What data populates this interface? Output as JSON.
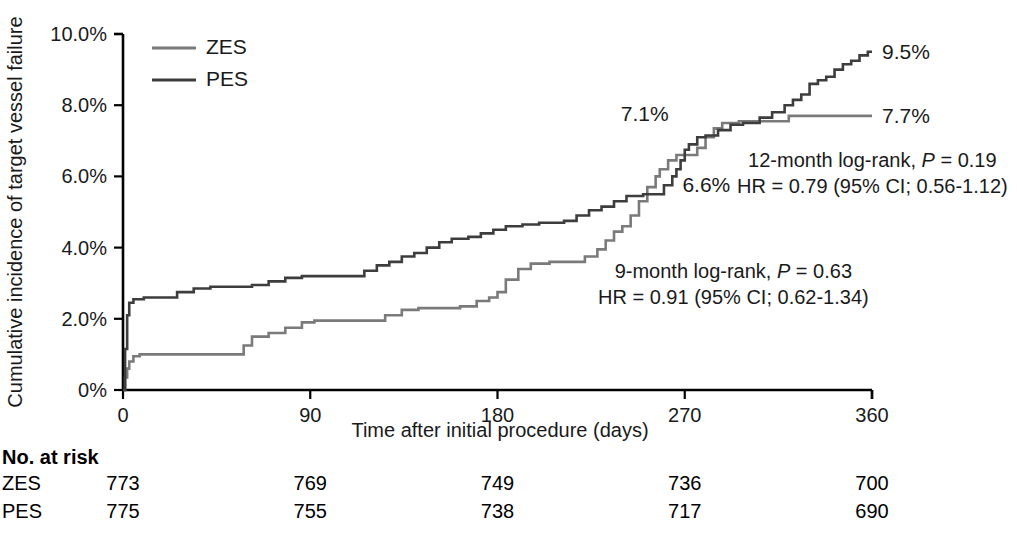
{
  "chart_data": {
    "type": "line",
    "subtype": "kaplan-meier-cumulative-incidence",
    "title": "",
    "xlabel": "Time after initial procedure (days)",
    "ylabel": "Cumulative incidence of target vessel failure",
    "xlim": [
      0,
      360
    ],
    "ylim": [
      0,
      10
    ],
    "grid": false,
    "legend_position": "top-left-inside",
    "xticks": [
      0,
      90,
      180,
      270,
      360
    ],
    "xticklabels": [
      "0",
      "90",
      "180",
      "270",
      "360"
    ],
    "yticks": [
      0,
      2,
      4,
      6,
      8,
      10
    ],
    "yticklabels": [
      "0%",
      "2.0%",
      "4.0%",
      "6.0%",
      "8.0%",
      "10.0%"
    ],
    "series": [
      {
        "name": "ZES",
        "color": "#7a7a7a",
        "final_value": 7.7,
        "final_label": "7.7%",
        "points": [
          [
            0,
            0.0
          ],
          [
            1,
            0.35
          ],
          [
            2,
            0.6
          ],
          [
            3,
            0.8
          ],
          [
            5,
            0.95
          ],
          [
            8,
            1.0
          ],
          [
            55,
            1.0
          ],
          [
            58,
            1.25
          ],
          [
            62,
            1.5
          ],
          [
            70,
            1.6
          ],
          [
            78,
            1.75
          ],
          [
            86,
            1.9
          ],
          [
            92,
            1.95
          ],
          [
            100,
            1.95
          ],
          [
            118,
            1.95
          ],
          [
            126,
            2.1
          ],
          [
            134,
            2.25
          ],
          [
            142,
            2.3
          ],
          [
            150,
            2.3
          ],
          [
            162,
            2.35
          ],
          [
            170,
            2.5
          ],
          [
            176,
            2.6
          ],
          [
            180,
            2.75
          ],
          [
            184,
            3.1
          ],
          [
            190,
            3.4
          ],
          [
            196,
            3.55
          ],
          [
            205,
            3.6
          ],
          [
            216,
            3.6
          ],
          [
            222,
            3.75
          ],
          [
            228,
            3.95
          ],
          [
            232,
            4.2
          ],
          [
            236,
            4.45
          ],
          [
            240,
            4.6
          ],
          [
            244,
            4.9
          ],
          [
            248,
            5.3
          ],
          [
            252,
            5.7
          ],
          [
            256,
            6.0
          ],
          [
            258,
            6.2
          ],
          [
            262,
            6.45
          ],
          [
            266,
            6.6
          ],
          [
            270,
            6.6
          ],
          [
            276,
            6.8
          ],
          [
            280,
            7.1
          ],
          [
            284,
            7.35
          ],
          [
            288,
            7.5
          ],
          [
            296,
            7.55
          ],
          [
            312,
            7.55
          ],
          [
            320,
            7.7
          ],
          [
            360,
            7.7
          ]
        ]
      },
      {
        "name": "PES",
        "color": "#3d3d3d",
        "final_value": 9.5,
        "final_label": "9.5%",
        "points": [
          [
            0,
            0.0
          ],
          [
            1,
            1.15
          ],
          [
            2,
            2.1
          ],
          [
            3,
            2.45
          ],
          [
            5,
            2.55
          ],
          [
            10,
            2.6
          ],
          [
            20,
            2.6
          ],
          [
            26,
            2.75
          ],
          [
            34,
            2.85
          ],
          [
            42,
            2.9
          ],
          [
            50,
            2.9
          ],
          [
            62,
            2.95
          ],
          [
            70,
            3.05
          ],
          [
            78,
            3.15
          ],
          [
            86,
            3.2
          ],
          [
            94,
            3.2
          ],
          [
            108,
            3.2
          ],
          [
            116,
            3.35
          ],
          [
            122,
            3.5
          ],
          [
            128,
            3.6
          ],
          [
            134,
            3.75
          ],
          [
            140,
            3.85
          ],
          [
            146,
            4.0
          ],
          [
            152,
            4.15
          ],
          [
            158,
            4.25
          ],
          [
            166,
            4.3
          ],
          [
            172,
            4.4
          ],
          [
            178,
            4.5
          ],
          [
            184,
            4.6
          ],
          [
            192,
            4.65
          ],
          [
            200,
            4.7
          ],
          [
            212,
            4.75
          ],
          [
            218,
            4.9
          ],
          [
            224,
            5.05
          ],
          [
            230,
            5.15
          ],
          [
            236,
            5.3
          ],
          [
            242,
            5.45
          ],
          [
            250,
            5.5
          ],
          [
            256,
            5.5
          ],
          [
            260,
            5.75
          ],
          [
            264,
            6.0
          ],
          [
            266,
            6.2
          ],
          [
            268,
            6.45
          ],
          [
            270,
            6.75
          ],
          [
            272,
            6.9
          ],
          [
            276,
            7.1
          ],
          [
            280,
            7.15
          ],
          [
            286,
            7.3
          ],
          [
            292,
            7.45
          ],
          [
            298,
            7.5
          ],
          [
            306,
            7.65
          ],
          [
            312,
            7.8
          ],
          [
            318,
            8.0
          ],
          [
            322,
            8.15
          ],
          [
            326,
            8.3
          ],
          [
            330,
            8.6
          ],
          [
            334,
            8.7
          ],
          [
            338,
            8.8
          ],
          [
            342,
            9.0
          ],
          [
            346,
            9.15
          ],
          [
            350,
            9.25
          ],
          [
            354,
            9.4
          ],
          [
            358,
            9.5
          ],
          [
            360,
            9.5
          ]
        ]
      }
    ],
    "curve_annotations": [
      {
        "name": "zes-9month-label",
        "text": "6.6%",
        "x": 270,
        "y": 6.6
      },
      {
        "name": "pes-9month-label",
        "text": "7.1%",
        "x": 270,
        "y": 6.75
      }
    ]
  },
  "legend": {
    "items": [
      {
        "label": "ZES",
        "color": "#7a7a7a"
      },
      {
        "label": "PES",
        "color": "#3d3d3d"
      }
    ]
  },
  "axes": {
    "y_title": "Cumulative incidence of target vessel failure",
    "x_title": "Time after initial procedure (days)"
  },
  "endpoint_labels": {
    "pes": "9.5%",
    "zes": "7.7%",
    "pes_9month": "7.1%",
    "zes_9month": "6.6%"
  },
  "annotations": {
    "nine_month": {
      "line1_pre": "9-month log-rank, ",
      "line1_ital": "P",
      "line1_post": " = 0.63",
      "line2": "HR = 0.91 (95% CI; 0.62-1.34)"
    },
    "twelve_month": {
      "line1_pre": "12-month log-rank, ",
      "line1_ital": "P",
      "line1_post": " = 0.19",
      "line2": "HR = 0.79 (95% CI; 0.56-1.12)"
    }
  },
  "risk_table": {
    "title": "No. at risk",
    "timepoints": [
      0,
      90,
      180,
      270,
      360
    ],
    "rows": [
      {
        "label": "ZES",
        "values": [
          "773",
          "769",
          "749",
          "736",
          "700"
        ]
      },
      {
        "label": "PES",
        "values": [
          "775",
          "755",
          "738",
          "717",
          "690"
        ]
      }
    ]
  },
  "geometry": {
    "plot_left": 123,
    "plot_right": 872,
    "plot_top": 34,
    "plot_bottom": 390
  }
}
